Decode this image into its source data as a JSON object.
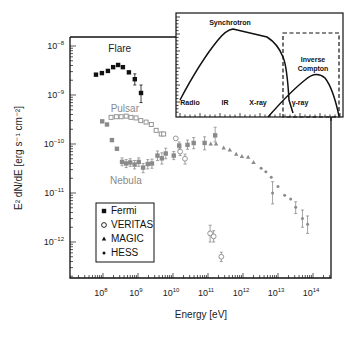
{
  "chart_data": {
    "type": "scatter",
    "title": "",
    "xlabel": "Energy [eV]",
    "ylabel": "E^2 dN/dE [erg s^-1 cm^-2]",
    "xscale": "log",
    "yscale": "log",
    "xlim": [
      25000000.0,
      200000000000000.0
    ],
    "ylim": [
      1.8e-13,
      1.5e-08
    ],
    "x_ticks": [
      {
        "exp": "8",
        "value": 100000000.0
      },
      {
        "exp": "9",
        "value": 1000000000.0
      },
      {
        "exp": "10",
        "value": 10000000000.0
      },
      {
        "exp": "11",
        "value": 100000000000.0
      },
      {
        "exp": "12",
        "value": 1000000000000.0
      },
      {
        "exp": "13",
        "value": 10000000000000.0
      },
      {
        "exp": "14",
        "value": 100000000000000.0
      }
    ],
    "y_ticks": [
      {
        "exp": "−8",
        "value": 1e-08
      },
      {
        "exp": "−9",
        "value": 1e-09
      },
      {
        "exp": "−10",
        "value": 1e-10
      },
      {
        "exp": "−11",
        "value": 1e-11
      },
      {
        "exp": "−12",
        "value": 1e-12
      }
    ],
    "tick_base": "10",
    "annotations": [
      {
        "text": "Flare",
        "x": 300000000.0,
        "y": 7.5e-09,
        "color": "#222222"
      },
      {
        "text": "Pulsar",
        "x": 420000000.0,
        "y": 4.6e-10,
        "color": "#8a8a8a"
      },
      {
        "text": "Nebula",
        "x": 450000000.0,
        "y": 1.5e-11,
        "color": "#8a8a8a"
      }
    ],
    "legend": {
      "position": "lower-left",
      "entries": [
        {
          "label": "Fermi",
          "marker": "square"
        },
        {
          "label": "VERITAS",
          "marker": "circle-open"
        },
        {
          "label": "MAGIC",
          "marker": "triangle"
        },
        {
          "label": "HESS",
          "marker": "dot"
        }
      ]
    },
    "series": [
      {
        "name": "Fermi flare",
        "marker": "square",
        "color": "#111111",
        "points": [
          {
            "x": 63000000.0,
            "y": 2.6e-09
          },
          {
            "x": 93000000.0,
            "y": 2.8e-09
          },
          {
            "x": 138000000.0,
            "y": 3.1e-09
          },
          {
            "x": 195000000.0,
            "y": 3.7e-09
          },
          {
            "x": 270000000.0,
            "y": 4.1e-09
          },
          {
            "x": 370000000.0,
            "y": 3.7e-09
          },
          {
            "x": 550000000.0,
            "y": 2.9e-09
          },
          {
            "x": 810000000.0,
            "y": 2.1e-09,
            "err": [
              1.6e-09,
              2.7e-09
            ]
          },
          {
            "x": 1220000000.0,
            "y": 1.1e-09,
            "err": [
              7e-10,
              1.6e-09
            ]
          }
        ]
      },
      {
        "name": "Fermi pulsar",
        "marker": "square-open",
        "color": "#8a8a8a",
        "points": [
          {
            "x": 170000000.0,
            "y": 3.5e-10
          },
          {
            "x": 240000000.0,
            "y": 3.6e-10
          },
          {
            "x": 330000000.0,
            "y": 3.6e-10
          },
          {
            "x": 460000000.0,
            "y": 3.7e-10
          },
          {
            "x": 630000000.0,
            "y": 3.5e-10
          },
          {
            "x": 880000000.0,
            "y": 3.4e-10
          },
          {
            "x": 1200000000.0,
            "y": 3e-10
          },
          {
            "x": 1700000000.0,
            "y": 2.8e-10
          },
          {
            "x": 2400000000.0,
            "y": 2.5e-10
          },
          {
            "x": 3300000000.0,
            "y": 1.9e-10
          },
          {
            "x": 4600000000.0,
            "y": 1.6e-10
          },
          {
            "x": 5400000000.0,
            "y": 1.6e-10
          }
        ]
      },
      {
        "name": "Fermi nebula",
        "marker": "square",
        "color": "#8a8a8a",
        "points": [
          {
            "x": 95000000.0,
            "y": 2.9e-10
          },
          {
            "x": 130000000.0,
            "y": 2.5e-10
          },
          {
            "x": 180000000.0,
            "y": 1.2e-10
          },
          {
            "x": 250000000.0,
            "y": 8e-11
          },
          {
            "x": 350000000.0,
            "y": 4.3e-11,
            "err": [
              3.6e-11,
              5.2e-11
            ]
          },
          {
            "x": 460000000.0,
            "y": 4e-11,
            "err": [
              3.3e-11,
              4.8e-11
            ]
          },
          {
            "x": 600000000.0,
            "y": 4.2e-11,
            "err": [
              3.5e-11,
              5e-11
            ]
          },
          {
            "x": 800000000.0,
            "y": 3.8e-11,
            "err": [
              3.1e-11,
              4.6e-11
            ]
          },
          {
            "x": 1050000000.0,
            "y": 4.3e-11,
            "err": [
              3.5e-11,
              5.2e-11
            ]
          },
          {
            "x": 1400000000.0,
            "y": 3.3e-11,
            "err": [
              2.6e-11,
              4e-11
            ]
          },
          {
            "x": 1900000000.0,
            "y": 3.9e-11,
            "err": [
              3.1e-11,
              4.8e-11
            ]
          },
          {
            "x": 2500000000.0,
            "y": 4e-11,
            "err": [
              3.2e-11,
              4.9e-11
            ]
          },
          {
            "x": 3600000000.0,
            "y": 5.8e-11,
            "err": [
              4.6e-11,
              7.2e-11
            ]
          },
          {
            "x": 4800000000.0,
            "y": 5.1e-11,
            "err": [
              3.9e-11,
              6.6e-11
            ]
          },
          {
            "x": 6200000000.0,
            "y": 6.4e-11,
            "err": [
              5e-11,
              8.2e-11
            ]
          },
          {
            "x": 10500000000.0,
            "y": 5.8e-11,
            "err": [
              4.8e-11,
              7e-11
            ]
          },
          {
            "x": 15000000000.0,
            "y": 9.3e-11,
            "err": [
              7.8e-11,
              1.1e-10
            ]
          },
          {
            "x": 26000000000.0,
            "y": 9.6e-11,
            "err": [
              7.8e-11,
              1.2e-10
            ]
          },
          {
            "x": 39000000000.0,
            "y": 1.05e-10,
            "err": [
              8e-11,
              1.35e-10
            ]
          },
          {
            "x": 80000000000.0,
            "y": 1.05e-10,
            "err": [
              7.6e-11,
              1.4e-10
            ]
          },
          {
            "x": 160000000000.0,
            "y": 1.5e-10,
            "err": [
              1.1e-10,
              2.2e-10
            ]
          }
        ]
      },
      {
        "name": "VERITAS",
        "marker": "circle-open",
        "color": "#8a8a8a",
        "points": [
          {
            "x": 12000000000.0,
            "y": 1.3e-10
          },
          {
            "x": 16000000000.0,
            "y": 7e-11,
            "err": [
              5.8e-11,
              8.4e-11
            ]
          },
          {
            "x": 22000000000.0,
            "y": 5e-11,
            "err": [
              3.9e-11,
              6.2e-11
            ]
          },
          {
            "x": 115000000000.0,
            "y": 1.5e-12,
            "err": [
              1e-12,
              2.2e-12
            ]
          },
          {
            "x": 145000000000.0,
            "y": 1.3e-12,
            "err": [
              1e-12,
              1.7e-12
            ]
          },
          {
            "x": 240000000000.0,
            "y": 5e-13,
            "err": [
              4e-13,
              6.2e-13
            ]
          }
        ]
      },
      {
        "name": "MAGIC",
        "marker": "triangle",
        "color": "#8a8a8a",
        "points": [
          {
            "x": 120000000000.0,
            "y": 1e-10
          },
          {
            "x": 170000000000.0,
            "y": 1e-10
          },
          {
            "x": 280000000000.0,
            "y": 8.3e-11
          },
          {
            "x": 420000000000.0,
            "y": 7.6e-11
          },
          {
            "x": 640000000000.0,
            "y": 6.2e-11
          },
          {
            "x": 930000000000.0,
            "y": 5.6e-11
          },
          {
            "x": 1400000000000.0,
            "y": 5.4e-11
          },
          {
            "x": 2000000000000.0,
            "y": 4.2e-11
          }
        ]
      },
      {
        "name": "HESS",
        "marker": "dot",
        "color": "#8a8a8a",
        "points": [
          {
            "x": 3300000000000.0,
            "y": 3.2e-11
          },
          {
            "x": 4500000000000.0,
            "y": 2.7e-11
          },
          {
            "x": 6400000000000.0,
            "y": 2.1e-11
          },
          {
            "x": 7000000000000.0,
            "y": 1e-11,
            "err": [
              6e-12,
              1.7e-11
            ]
          },
          {
            "x": 10000000000000.0,
            "y": 1.35e-11
          },
          {
            "x": 15500000000000.0,
            "y": 9e-12
          },
          {
            "x": 23000000000000.0,
            "y": 7.5e-12
          },
          {
            "x": 32000000000000.0,
            "y": 5.1e-12,
            "err": [
              3.8e-12,
              6.6e-12
            ]
          },
          {
            "x": 50000000000000.0,
            "y": 3e-12,
            "err": [
              2e-12,
              4.5e-12
            ]
          },
          {
            "x": 70000000000000.0,
            "y": 2.3e-12,
            "err": [
              1.5e-12,
              3.4e-12
            ]
          }
        ]
      }
    ],
    "inset": {
      "type": "diagram",
      "description": "Schematic broadband SED: synchrotron hump and inverse Compton hump",
      "curve_labels": [
        "Synchrotron",
        "Inverse Compton"
      ],
      "band_labels": [
        "Radio",
        "IR",
        "X-ray",
        "γ-ray"
      ],
      "highlight_box": "dashed box around gamma-ray / inverse Compton region"
    }
  }
}
